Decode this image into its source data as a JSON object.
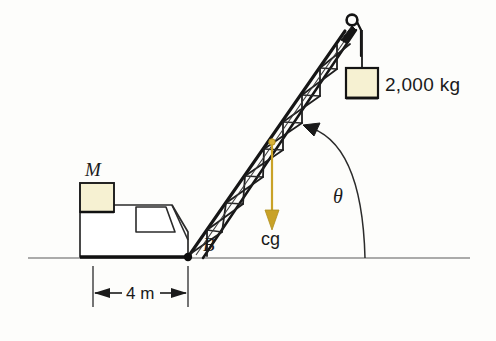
{
  "figure": {
    "background_color": "#fdfdfb"
  },
  "labels": {
    "counterweight": "M",
    "pivot": "B",
    "center_of_gravity": "cg",
    "boom_angle": "θ",
    "load_mass": "2,000 kg",
    "base_distance": "4 m"
  },
  "colors": {
    "ink": "#1a1a1a",
    "line": "#222222",
    "ground": "#8a8a8a",
    "block_fill": "#f6f1d2",
    "block_stroke": "#1a1a1a",
    "cg_accent": "#c9a227",
    "body_fill": "#ffffff"
  },
  "geometry": {
    "ground_y": 258,
    "ground_x_start": 28,
    "ground_x_end": 470,
    "pivot_point": {
      "x": 188,
      "y": 257
    },
    "boom_tip": {
      "x": 352,
      "y": 22
    },
    "cg_point": {
      "x": 272,
      "y": 142
    },
    "cg_arrow_end": {
      "x": 272,
      "y": 228
    },
    "load_box": {
      "x": 346,
      "y": 68,
      "w": 32,
      "h": 30
    },
    "counterweight_box": {
      "x": 80,
      "y": 183,
      "w": 34,
      "h": 29
    },
    "dimension_line_y": 293,
    "dimension_left_x": 93,
    "dimension_right_x": 188,
    "angle_arc_ground_x": 365
  }
}
